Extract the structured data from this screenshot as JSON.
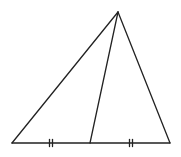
{
  "diagram": {
    "type": "geometry",
    "stroke_color": "#222222",
    "background": "#ffffff",
    "points": {
      "apex": [
        118,
        12
      ],
      "base_left": [
        12,
        143
      ],
      "base_right": [
        170,
        143
      ],
      "midpoint": [
        90,
        143
      ]
    },
    "tick_marks": {
      "count_per_segment": 2,
      "positions": [
        [
          51,
          143
        ],
        [
          131,
          143
        ]
      ]
    }
  }
}
